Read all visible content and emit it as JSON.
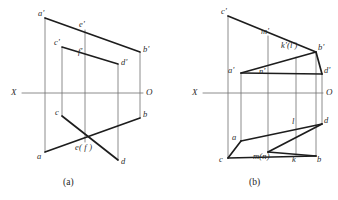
{
  "drawing": {
    "title": "Orthographic projection exercise — two figures",
    "background_color": "#ffffff",
    "line_color_heavy": "#1d1d1d",
    "line_color_light": "#6e6e6e",
    "text_color": "#2b2b2b"
  },
  "figures": [
    {
      "id": "a",
      "caption": "(a)",
      "caption_pos": {
        "x": 63,
        "y": 178
      },
      "axis": {
        "left_label": "X",
        "right_label": "O",
        "left_label_pos": {
          "x": 11,
          "y": 88
        },
        "right_label_pos": {
          "x": 146,
          "y": 88
        },
        "y": 93,
        "x1": 22,
        "x2": 143
      },
      "vertical_lines": [
        {
          "name": "vline-a",
          "x": 45,
          "y1": 18,
          "y2": 152
        },
        {
          "name": "vline-c",
          "x": 62,
          "y1": 47,
          "y2": 116
        },
        {
          "name": "vline-ef",
          "x": 85,
          "y1": 30,
          "y2": 142
        },
        {
          "name": "vline-d",
          "x": 118,
          "y1": 64,
          "y2": 160
        },
        {
          "name": "vline-b",
          "x": 140,
          "y1": 52,
          "y2": 118
        }
      ],
      "heavy_segments": [
        {
          "name": "seg-ap-bp",
          "x1": 45,
          "y1": 18,
          "x2": 140,
          "y2": 52
        },
        {
          "name": "seg-cp-dp",
          "x1": 62,
          "y1": 47,
          "x2": 118,
          "y2": 64
        },
        {
          "name": "seg-a-b",
          "x1": 45,
          "y1": 152,
          "x2": 140,
          "y2": 118
        },
        {
          "name": "seg-c-d",
          "x1": 62,
          "y1": 116,
          "x2": 118,
          "y2": 160
        }
      ],
      "labels": [
        {
          "name": "label-a-prime",
          "text": "a'",
          "x": 38,
          "y": 9
        },
        {
          "name": "label-e-prime",
          "text": "e'",
          "x": 79,
          "y": 20
        },
        {
          "name": "label-b-prime",
          "text": "b'",
          "x": 143,
          "y": 45
        },
        {
          "name": "label-c-prime",
          "text": "c'",
          "x": 54,
          "y": 38
        },
        {
          "name": "label-f-prime",
          "text": "f'",
          "x": 78,
          "y": 47
        },
        {
          "name": "label-d-prime",
          "text": "d'",
          "x": 121,
          "y": 58
        },
        {
          "name": "label-c",
          "text": "c",
          "x": 55,
          "y": 108
        },
        {
          "name": "label-b",
          "text": "b",
          "x": 143,
          "y": 110
        },
        {
          "name": "label-a",
          "text": "a",
          "x": 37,
          "y": 152
        },
        {
          "name": "label-ef",
          "text": "e( f )",
          "x": 75,
          "y": 143
        },
        {
          "name": "label-d",
          "text": "d",
          "x": 121,
          "y": 157
        }
      ]
    },
    {
      "id": "b",
      "caption": "(b)",
      "caption_pos": {
        "x": 249,
        "y": 178
      },
      "axis": {
        "left_label": "X",
        "right_label": "O",
        "left_label_pos": {
          "x": 192,
          "y": 88
        },
        "right_label_pos": {
          "x": 326,
          "y": 88
        },
        "y": 93,
        "x1": 203,
        "x2": 323
      },
      "vertical_lines": [
        {
          "name": "vline-c",
          "x": 228,
          "y1": 16,
          "y2": 158
        },
        {
          "name": "vline-a",
          "x": 241,
          "y1": 73,
          "y2": 141
        },
        {
          "name": "vline-mn",
          "x": 268,
          "y1": 36,
          "y2": 152
        },
        {
          "name": "vline-kl",
          "x": 296,
          "y1": 57,
          "y2": 155
        },
        {
          "name": "vline-bd",
          "x": 316,
          "y1": 52,
          "y2": 156
        },
        {
          "name": "vline-dprime",
          "x": 322,
          "y1": 74,
          "y2": 124
        }
      ],
      "heavy_segments": [
        {
          "name": "seg-cp-bp",
          "x1": 228,
          "y1": 16,
          "x2": 316,
          "y2": 52
        },
        {
          "name": "seg-ap-dp",
          "x1": 241,
          "y1": 73,
          "x2": 322,
          "y2": 74
        },
        {
          "name": "seg-ap-dp-slant",
          "x1": 241,
          "y1": 73,
          "x2": 316,
          "y2": 52
        },
        {
          "name": "seg-bp-dp",
          "x1": 316,
          "y1": 52,
          "x2": 322,
          "y2": 74
        },
        {
          "name": "seg-c-b",
          "x1": 228,
          "y1": 158,
          "x2": 316,
          "y2": 156
        },
        {
          "name": "seg-a-d",
          "x1": 241,
          "y1": 141,
          "x2": 322,
          "y2": 124
        },
        {
          "name": "seg-c-a",
          "x1": 228,
          "y1": 158,
          "x2": 241,
          "y2": 141
        },
        {
          "name": "seg-mn-d",
          "x1": 268,
          "y1": 152,
          "x2": 322,
          "y2": 124
        },
        {
          "name": "seg-b-l",
          "x1": 316,
          "y1": 156,
          "x2": 268,
          "y2": 152
        }
      ],
      "labels": [
        {
          "name": "label-c-prime",
          "text": "c'",
          "x": 221,
          "y": 7
        },
        {
          "name": "label-m-prime",
          "text": "m'",
          "x": 261,
          "y": 27
        },
        {
          "name": "label-k-l-prime",
          "text": "k'(l')",
          "x": 281,
          "y": 41
        },
        {
          "name": "label-b-prime",
          "text": "b'",
          "x": 318,
          "y": 43
        },
        {
          "name": "label-a-prime",
          "text": "a'",
          "x": 228,
          "y": 66
        },
        {
          "name": "label-n-prime",
          "text": "n'",
          "x": 259,
          "y": 67
        },
        {
          "name": "label-d-prime",
          "text": "d'",
          "x": 324,
          "y": 66
        },
        {
          "name": "label-l",
          "text": "l",
          "x": 292,
          "y": 117
        },
        {
          "name": "label-d",
          "text": "d",
          "x": 324,
          "y": 116
        },
        {
          "name": "label-a",
          "text": "a",
          "x": 232,
          "y": 133
        },
        {
          "name": "label-c",
          "text": "c",
          "x": 219,
          "y": 155
        },
        {
          "name": "label-m-n",
          "text": "m(n)",
          "x": 253,
          "y": 152
        },
        {
          "name": "label-k",
          "text": "k",
          "x": 292,
          "y": 155
        },
        {
          "name": "label-b",
          "text": "b",
          "x": 317,
          "y": 155
        }
      ]
    }
  ]
}
